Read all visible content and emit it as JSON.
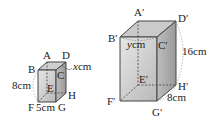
{
  "colors": {
    "stroke": "#444444",
    "front_face": "#d4d4d4",
    "side_face": "#a9a9a9",
    "top_face": "#c6c6c6",
    "dim_arc": "#999999"
  },
  "small_prism": {
    "vertices": {
      "A": "A",
      "B": "B",
      "C": "C",
      "D": "D",
      "E": "E",
      "F": "F",
      "G": "G",
      "H": "H"
    },
    "height_label": "8cm",
    "width_label": "5cm",
    "depth_var": "x",
    "depth_unit": "cm"
  },
  "large_prism": {
    "vertices": {
      "A": "A′",
      "B": "B′",
      "C": "C′",
      "D": "D′",
      "E": "E′",
      "F": "F′",
      "G": "G′",
      "H": "H′"
    },
    "height_label": "16cm",
    "depth_label": "8cm",
    "width_var": "y",
    "width_unit": "cm"
  }
}
